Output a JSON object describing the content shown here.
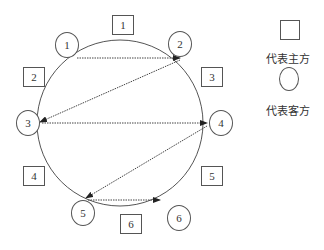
{
  "diagram": {
    "host_boxes": [
      {
        "label": "1",
        "x": 112,
        "y": 15
      },
      {
        "label": "2",
        "x": 24,
        "y": 67
      },
      {
        "label": "3",
        "x": 202,
        "y": 67
      },
      {
        "label": "4",
        "x": 24,
        "y": 167
      },
      {
        "label": "5",
        "x": 202,
        "y": 166
      },
      {
        "label": "6",
        "x": 120,
        "y": 215
      }
    ],
    "guest_ovals": [
      {
        "label": "1",
        "x": 55,
        "y": 38
      },
      {
        "label": "2",
        "x": 168,
        "y": 32
      },
      {
        "label": "3",
        "x": 16,
        "y": 109
      },
      {
        "label": "4",
        "x": 208,
        "y": 110
      },
      {
        "label": "5",
        "x": 72,
        "y": 200
      },
      {
        "label": "6",
        "x": 168,
        "y": 205
      }
    ],
    "circle": {
      "cx": 118,
      "cy": 121,
      "r": 80
    },
    "arrows": [
      {
        "from": "1",
        "to": "2",
        "style": "dotted"
      },
      {
        "from": "2",
        "to": "3",
        "style": "dotted"
      },
      {
        "from": "3",
        "to": "4",
        "style": "dotted"
      },
      {
        "from": "4",
        "to": "5",
        "style": "dotted"
      },
      {
        "from": "5",
        "to": "6",
        "style": "dotted"
      }
    ],
    "legend": {
      "host_label": "代表主方",
      "guest_label": "代表客方"
    }
  }
}
